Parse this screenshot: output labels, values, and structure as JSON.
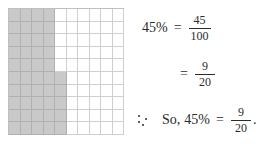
{
  "grid": {
    "label": "percent-grid",
    "rows": 10,
    "columns": 10,
    "total_cells": 100,
    "shaded_cells": 45,
    "shade_color": "#c9c9c9",
    "line_color": "#cfcfcf",
    "shaded_pattern": [
      4,
      4,
      4,
      4,
      4,
      5,
      5,
      5,
      5,
      5
    ]
  },
  "math": {
    "line1": {
      "percent": "45%",
      "equals": "=",
      "numerator": "45",
      "denominator": "100"
    },
    "line2": {
      "equals": "=",
      "numerator": "9",
      "denominator": "20"
    },
    "line3": {
      "therefore_symbol": "∴",
      "so": "So,",
      "percent": "45%",
      "equals": "=",
      "numerator": "9",
      "denominator": "20",
      "period": "."
    }
  }
}
